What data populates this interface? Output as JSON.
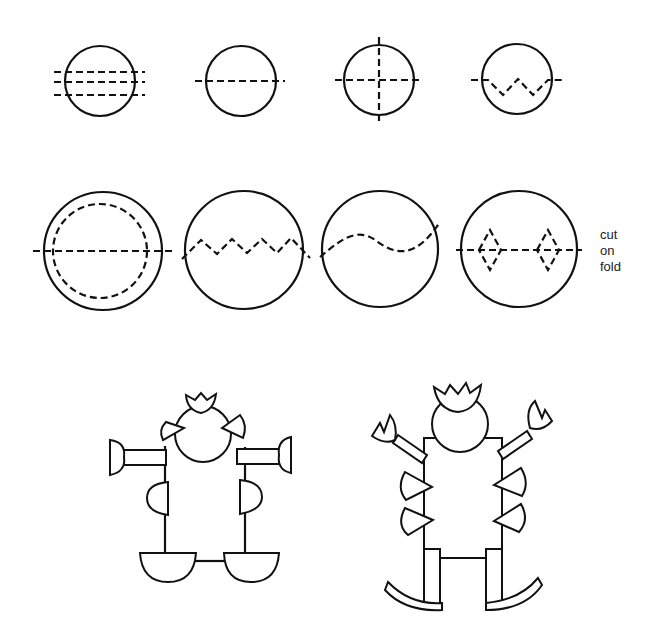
{
  "annotation": {
    "line1": "cut",
    "line2": "on",
    "line3": "fold"
  },
  "figures": {
    "row1": [
      "circle-three-dashed-lines",
      "circle-one-dashed-line",
      "circle-cross-dashed-lines",
      "circle-zigzag-fold"
    ],
    "row2": [
      "circle-with-inner-dashed-ring",
      "circle-zigzag-cut",
      "circle-wavy-cut",
      "circle-diamond-cut-on-fold"
    ],
    "row3": [
      "paper-robot-figure",
      "paper-crowned-figure-on-rockers"
    ]
  },
  "colors": {
    "ink": "#111111",
    "paper": "#ffffff"
  }
}
